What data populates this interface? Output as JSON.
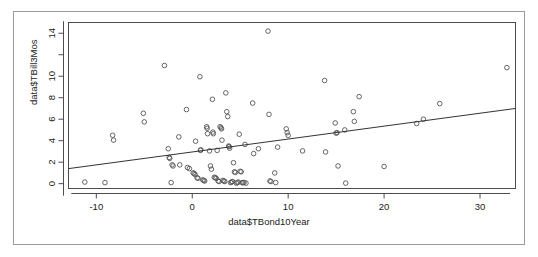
{
  "figure": {
    "type": "scatter-plot",
    "renderer": "r-base-graphics",
    "background": "#ffffff",
    "frame_color": "#9a9a9a",
    "axis_color": "#4d4d4d",
    "point_color": "#555555",
    "line_color": "#333333"
  },
  "chart_data": {
    "type": "scatter",
    "title": "",
    "xlabel": "data$TBond10Year",
    "ylabel": "data$TBill3Mos",
    "xlim": [
      -12.9,
      33.7
    ],
    "ylim": [
      -0.45,
      15.0
    ],
    "xticks": [
      -10,
      0,
      10,
      20,
      30
    ],
    "xticklabels": [
      "-10",
      "0",
      "10",
      "20",
      "30"
    ],
    "yticks": [
      0,
      2,
      4,
      6,
      8,
      10,
      12,
      14
    ],
    "yticklabels": [
      "0",
      "2",
      "4",
      "6",
      "8",
      "10",
      "",
      "14"
    ],
    "grid": false,
    "legend": null,
    "marker": "open-circle",
    "series": [
      {
        "name": "observations",
        "points": [
          [
            -11.2,
            0.15
          ],
          [
            -9.1,
            0.1
          ],
          [
            -8.3,
            4.5
          ],
          [
            -8.2,
            4.05
          ],
          [
            -5.1,
            6.55
          ],
          [
            -5.0,
            5.75
          ],
          [
            -2.9,
            11.0
          ],
          [
            -2.5,
            3.25
          ],
          [
            -2.4,
            2.45
          ],
          [
            -2.35,
            2.35
          ],
          [
            -2.2,
            0.1
          ],
          [
            -2.1,
            1.75
          ],
          [
            -2.0,
            1.65
          ],
          [
            -1.4,
            4.35
          ],
          [
            -1.3,
            1.75
          ],
          [
            -0.6,
            6.9
          ],
          [
            -0.5,
            1.5
          ],
          [
            -0.3,
            1.4
          ],
          [
            0.1,
            1.0
          ],
          [
            0.2,
            0.95
          ],
          [
            0.3,
            0.85
          ],
          [
            0.35,
            3.95
          ],
          [
            0.5,
            0.55
          ],
          [
            0.6,
            0.5
          ],
          [
            0.8,
            9.95
          ],
          [
            0.85,
            3.1
          ],
          [
            0.9,
            3.15
          ],
          [
            1.1,
            0.35
          ],
          [
            1.2,
            0.3
          ],
          [
            1.3,
            0.25
          ],
          [
            1.5,
            5.3
          ],
          [
            1.55,
            5.15
          ],
          [
            1.6,
            4.65
          ],
          [
            1.8,
            3.05
          ],
          [
            1.9,
            1.65
          ],
          [
            2.0,
            1.35
          ],
          [
            2.1,
            7.85
          ],
          [
            2.15,
            4.8
          ],
          [
            2.2,
            4.65
          ],
          [
            2.3,
            0.6
          ],
          [
            2.4,
            0.55
          ],
          [
            2.5,
            0.5
          ],
          [
            2.6,
            3.1
          ],
          [
            2.7,
            0.25
          ],
          [
            2.8,
            0.2
          ],
          [
            2.9,
            5.3
          ],
          [
            3.0,
            5.2
          ],
          [
            3.05,
            5.1
          ],
          [
            3.1,
            4.05
          ],
          [
            3.2,
            0.3
          ],
          [
            3.3,
            0.25
          ],
          [
            3.4,
            0.2
          ],
          [
            3.5,
            8.45
          ],
          [
            3.6,
            6.7
          ],
          [
            3.7,
            6.25
          ],
          [
            3.8,
            3.5
          ],
          [
            3.85,
            3.45
          ],
          [
            3.9,
            3.3
          ],
          [
            4.0,
            0.1
          ],
          [
            4.1,
            0.15
          ],
          [
            4.2,
            0.2
          ],
          [
            4.3,
            1.95
          ],
          [
            4.4,
            1.1
          ],
          [
            4.5,
            1.05
          ],
          [
            4.6,
            0.05
          ],
          [
            4.7,
            0.1
          ],
          [
            4.8,
            0.15
          ],
          [
            4.9,
            4.6
          ],
          [
            5.0,
            1.15
          ],
          [
            5.1,
            1.1
          ],
          [
            5.2,
            0.1
          ],
          [
            5.3,
            0.08
          ],
          [
            5.4,
            0.12
          ],
          [
            5.5,
            3.65
          ],
          [
            5.6,
            0.05
          ],
          [
            6.3,
            7.5
          ],
          [
            6.4,
            2.8
          ],
          [
            6.9,
            3.25
          ],
          [
            7.9,
            14.2
          ],
          [
            8.0,
            6.45
          ],
          [
            8.1,
            0.25
          ],
          [
            8.2,
            0.2
          ],
          [
            8.6,
            1.0
          ],
          [
            8.7,
            0.1
          ],
          [
            8.9,
            3.4
          ],
          [
            9.8,
            5.1
          ],
          [
            9.9,
            4.75
          ],
          [
            10.0,
            4.5
          ],
          [
            11.5,
            3.05
          ],
          [
            13.8,
            9.6
          ],
          [
            13.9,
            2.95
          ],
          [
            14.9,
            5.65
          ],
          [
            15.0,
            4.7
          ],
          [
            15.1,
            4.75
          ],
          [
            15.2,
            1.65
          ],
          [
            15.9,
            5.0
          ],
          [
            16.0,
            0.05
          ],
          [
            16.8,
            6.7
          ],
          [
            16.9,
            5.8
          ],
          [
            17.4,
            8.1
          ],
          [
            20.0,
            1.6
          ],
          [
            23.4,
            5.6
          ],
          [
            24.1,
            6.0
          ],
          [
            25.8,
            7.45
          ],
          [
            32.8,
            10.8
          ]
        ]
      }
    ],
    "trend_line": {
      "name": "regression-line",
      "x_start": -12.9,
      "y_start": 1.4,
      "x_end": 33.7,
      "y_end": 7.0,
      "slope": 0.12,
      "intercept": 2.95
    }
  }
}
